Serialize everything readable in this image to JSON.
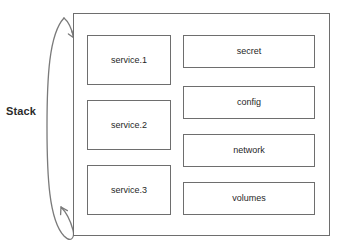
{
  "diagram": {
    "side_label": "Stack",
    "loop_arrow_name": "stack-loop-arrow",
    "colors": {
      "background": "#ffffff",
      "box_fill": "#ffffff",
      "box_stroke": "#6e6e6e",
      "text": "#1f1f1f",
      "label_text": "#2b2b2b",
      "arrow_stroke": "#7a7a7a"
    },
    "services": [
      {
        "label": "service.1"
      },
      {
        "label": "service.2"
      },
      {
        "label": "service.3"
      }
    ],
    "resources": [
      {
        "label": "secret"
      },
      {
        "label": "config"
      },
      {
        "label": "network"
      },
      {
        "label": "volumes"
      }
    ]
  }
}
